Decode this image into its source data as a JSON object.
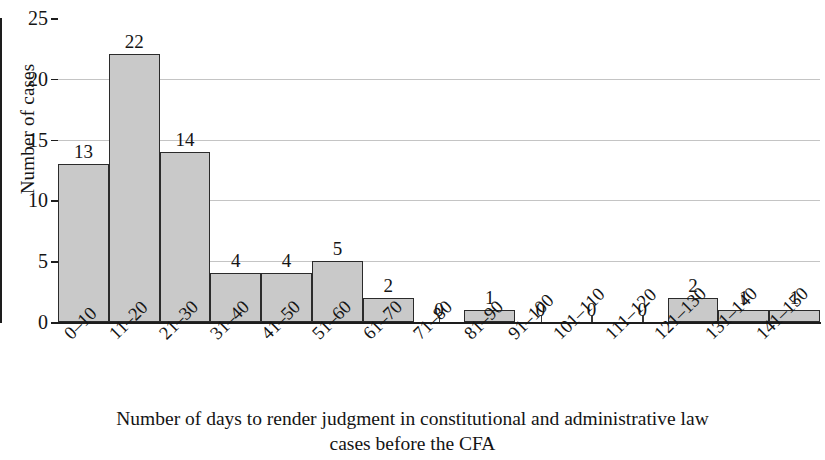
{
  "chart_data": {
    "type": "bar",
    "title": "",
    "subtitle": "",
    "categories": [
      "0–10",
      "11–20",
      "21–30",
      "31–40",
      "41–50",
      "51–60",
      "61–70",
      "71–80",
      "81–90",
      "91–100",
      "101–110",
      "111–120",
      "121–130",
      "131–140",
      "141–150"
    ],
    "values": [
      13,
      22,
      14,
      4,
      4,
      5,
      2,
      0,
      1,
      0,
      0,
      0,
      2,
      1,
      1
    ],
    "data_labels": [
      "13",
      "22",
      "14",
      "4",
      "4",
      "5",
      "2",
      "0",
      "1",
      "0",
      "0",
      "0",
      "2",
      "1",
      "1"
    ],
    "xlabel": "Number of days to render judgment in constitutional and administrative law cases before the CFA",
    "ylabel": "Number of cases",
    "ylim": [
      0,
      25
    ],
    "ytick_values": [
      0,
      5,
      10,
      15,
      20,
      25
    ],
    "ytick_labels": [
      "0",
      "5",
      "10",
      "15",
      "20",
      "25"
    ],
    "gridline_values": [
      5,
      10,
      15,
      20
    ],
    "grid": true,
    "legend": false,
    "legend_position": "none",
    "bar_fill_color": "#c9c9c9",
    "bar_edge_color": "#2b2b2b",
    "grid_color": "#c4c4c4",
    "axis_color": "#1d1d1d",
    "xtick_rotation": -45,
    "bars_contiguous": true
  },
  "caption": {
    "line1": "Number of days to render judgment in constitutional and administrative law",
    "line2": "cases before the CFA"
  },
  "axes": {
    "y_title": "Number of cases"
  }
}
